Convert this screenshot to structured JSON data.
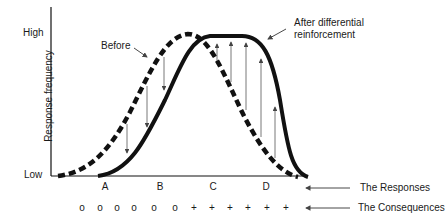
{
  "axis": {
    "y_label": "Response frequency",
    "high_label": "High",
    "low_label": "Low"
  },
  "curves": {
    "before_label": "Before",
    "after_label_line1": "After differential",
    "after_label_line2": "reinforcement"
  },
  "responses": {
    "label": "The Responses",
    "letters": [
      "A",
      "B",
      "C",
      "D"
    ]
  },
  "consequences": {
    "label": "The Consequences",
    "symbols": [
      "o",
      "o",
      "o",
      "o",
      "o",
      "o",
      "+",
      "+",
      "+",
      "+",
      "+",
      "+"
    ]
  },
  "colors": {
    "ink": "#111111",
    "arrow": "#555555"
  }
}
